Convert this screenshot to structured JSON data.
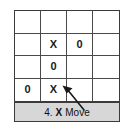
{
  "figure": {
    "type": "tic-tac-toe-board",
    "caption": {
      "step_number": "4.",
      "mark": "X",
      "action": "Move",
      "full_text": "4. X Move",
      "background_color": "#d7d7d7"
    },
    "board": {
      "rows": 4,
      "columns": 4,
      "border_color": "#3b3b3b",
      "grid_line_color": "#4a4a4a",
      "background_color": "#ffffff",
      "cells": [
        [
          "",
          "",
          "",
          ""
        ],
        [
          "",
          "X",
          "0",
          ""
        ],
        [
          "",
          "0",
          "",
          ""
        ],
        [
          "0",
          "X",
          "",
          ""
        ]
      ]
    },
    "annotation": {
      "name": "pointer-arrow",
      "points_to_cell": "row4-col2",
      "points_to_mark": "X",
      "color": "#1a1a1a"
    }
  }
}
